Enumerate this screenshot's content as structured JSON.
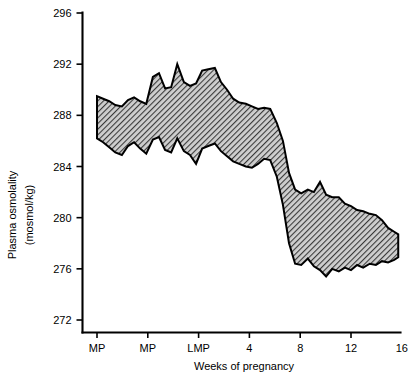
{
  "chart_data": {
    "type": "area",
    "title": "",
    "xlabel": "Weeks of pregnancy",
    "ylabel": "Plasma osmolality (mosmol/kg)",
    "ylabel_line1": "Plasma osmolality",
    "ylabel_line2": "(mosmol/kg)",
    "ylim": [
      272,
      296
    ],
    "ytick_values": [
      272,
      276,
      280,
      284,
      288,
      292,
      296
    ],
    "ytick_labels": [
      "272",
      "276",
      "280",
      "284",
      "288",
      "292",
      "296"
    ],
    "xtick_labels": [
      "MP",
      "MP",
      "LMP",
      "4",
      "8",
      "12",
      "16"
    ],
    "xtick_positions": [
      0,
      1,
      2,
      3,
      4,
      5,
      6
    ],
    "grid": false,
    "legend": null,
    "band_fill_color": "#9a9a9a",
    "band_outline_color": "#000000",
    "band_hatch": "diagonal-crosshatch",
    "x": [
      0.0,
      0.12,
      0.24,
      0.36,
      0.49,
      0.61,
      0.73,
      0.85,
      0.97,
      1.1,
      1.22,
      1.34,
      1.46,
      1.58,
      1.71,
      1.83,
      1.95,
      2.07,
      2.19,
      2.32,
      2.44,
      2.56,
      2.68,
      2.8,
      2.93,
      3.05,
      3.17,
      3.29,
      3.41,
      3.54,
      3.66,
      3.78,
      3.9,
      4.02,
      4.15,
      4.27,
      4.39,
      4.51,
      4.63,
      4.76,
      4.88,
      5.0,
      5.12,
      5.24,
      5.37,
      5.49,
      5.61,
      5.73,
      5.85,
      5.93
    ],
    "series": [
      {
        "name": "upper limit",
        "values": [
          289.5,
          289.3,
          289.1,
          288.8,
          288.7,
          289.2,
          289.4,
          289.1,
          288.9,
          291.0,
          291.3,
          290.1,
          290.2,
          292.0,
          290.6,
          290.3,
          290.5,
          291.5,
          291.6,
          291.7,
          290.6,
          290.0,
          289.3,
          289.0,
          288.9,
          288.7,
          288.5,
          288.6,
          288.5,
          287.4,
          286.0,
          283.5,
          282.2,
          281.9,
          282.2,
          282.0,
          282.8,
          281.8,
          281.6,
          281.6,
          281.1,
          280.9,
          280.6,
          280.5,
          280.3,
          280.2,
          279.8,
          279.2,
          278.9,
          278.7
        ]
      },
      {
        "name": "lower limit",
        "values": [
          286.2,
          285.9,
          285.5,
          285.1,
          284.9,
          285.6,
          285.9,
          285.4,
          285.0,
          286.1,
          286.3,
          285.3,
          285.1,
          286.2,
          285.2,
          284.9,
          284.2,
          285.4,
          285.6,
          285.8,
          285.2,
          284.8,
          284.4,
          284.2,
          284.0,
          283.9,
          284.2,
          284.6,
          284.5,
          283.2,
          281.0,
          278.0,
          276.4,
          276.3,
          276.8,
          276.2,
          275.9,
          275.4,
          276.0,
          275.8,
          276.1,
          275.9,
          276.3,
          276.1,
          276.4,
          276.3,
          276.6,
          276.5,
          276.7,
          276.9
        ]
      }
    ]
  }
}
